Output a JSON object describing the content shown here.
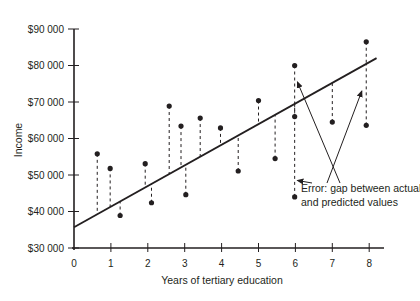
{
  "chart_data": {
    "type": "scatter",
    "title": "",
    "xlabel": "Years of tertiary education",
    "ylabel": "Income",
    "xlim": [
      0,
      8.4
    ],
    "ylim": [
      30000,
      90000
    ],
    "x_ticks": [
      0,
      1,
      2,
      3,
      4,
      5,
      6,
      7,
      8
    ],
    "x_tick_labels": [
      "0",
      "1",
      "2",
      "3",
      "4",
      "5",
      "6",
      "7",
      "8"
    ],
    "y_ticks": [
      30000,
      40000,
      50000,
      60000,
      70000,
      80000,
      90000
    ],
    "y_tick_labels": [
      "$30 000",
      "$40 000",
      "$50 000",
      "$60 000",
      "$70 000",
      "$80 000",
      "$90 000"
    ],
    "grid": false,
    "legend": null,
    "series": [
      {
        "name": "Actual income",
        "type": "scatter",
        "points": [
          {
            "x": 0.63,
            "y": 55800
          },
          {
            "x": 0.98,
            "y": 51800
          },
          {
            "x": 1.25,
            "y": 38900
          },
          {
            "x": 1.93,
            "y": 53100
          },
          {
            "x": 2.1,
            "y": 42400
          },
          {
            "x": 2.58,
            "y": 68900
          },
          {
            "x": 2.9,
            "y": 63400
          },
          {
            "x": 3.03,
            "y": 44600
          },
          {
            "x": 3.42,
            "y": 65600
          },
          {
            "x": 3.97,
            "y": 62900
          },
          {
            "x": 4.45,
            "y": 51100
          },
          {
            "x": 5.0,
            "y": 70400
          },
          {
            "x": 5.45,
            "y": 54500
          },
          {
            "x": 5.98,
            "y": 80000
          },
          {
            "x": 5.98,
            "y": 66000
          },
          {
            "x": 5.98,
            "y": 44000
          },
          {
            "x": 7.0,
            "y": 64500
          },
          {
            "x": 7.92,
            "y": 86500
          },
          {
            "x": 7.92,
            "y": 63600
          }
        ]
      },
      {
        "name": "Regression line (predicted values)",
        "type": "line",
        "intercept": 35700,
        "slope": 5650,
        "x_range": [
          0,
          8.2
        ]
      }
    ],
    "residual_lines": "dashed vertical lines from each actual point to the regression line",
    "annotations": [
      {
        "text_lines": [
          "Error: gap between actual",
          "and predicted values"
        ],
        "arrows_to": [
          {
            "x": 6.0,
            "y": 48500
          },
          {
            "x": 6.0,
            "y": 75500
          },
          {
            "x": 7.8,
            "y": 73000
          }
        ]
      }
    ]
  }
}
